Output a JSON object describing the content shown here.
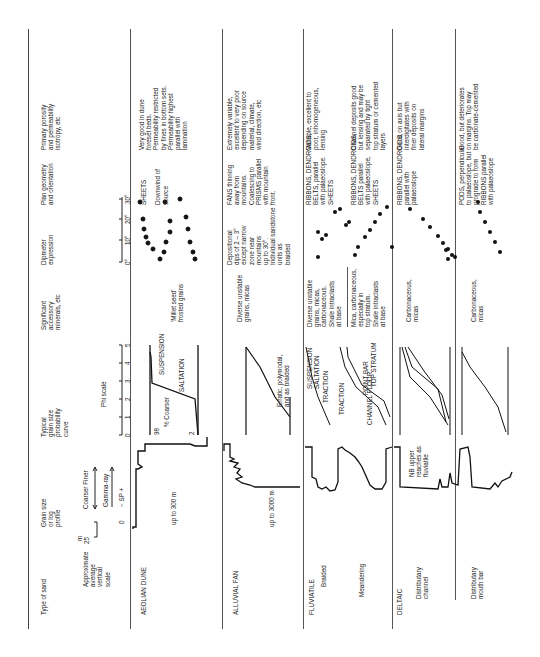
{
  "headers": {
    "type": "Type of sand",
    "scale": "Approximate\naverage\nvertical\nscale",
    "scale_unit": "m",
    "scale_top": "25",
    "scale_bottom": "0",
    "log": "Grain size\nor log\nprofile",
    "log_legend_grain": "Coarser  Finer",
    "log_legend_gamma": "Gamma-ray",
    "log_legend_sp": "−  SP  +",
    "curve": "Typical\ngrain size\nprobability\ncurve",
    "curve_axis": "Phi scale",
    "phi_ticks": [
      "0",
      "1",
      "2",
      "3",
      "4",
      "5"
    ],
    "minerals": "Significant\naccessory\nminerals, etc",
    "dip": "Dipmeter\nexpression",
    "dip_ticks": [
      "0°",
      "10°",
      "20°",
      "30°"
    ],
    "plan": "Plan geometry\nand orientation",
    "porosity": "Primary porosity\nand permeability\nisotropy, etc"
  },
  "rows": [
    {
      "type": "AEOLIAN DUNE",
      "log_note": "up to 300 m",
      "curve_labels": {
        "suspension": "SUSPENSION",
        "saltation": "SALTATION",
        "y98": "98",
        "y2": "2",
        "ylabel": "% Coarser"
      },
      "minerals": "'Millet seed'\nfrosted grains",
      "dip": "",
      "plan": "SHEETS\n\nDownwind of\nsource",
      "porosity": "Very good in dune\nforeset beds.\nPermeability restricted\nby fines in bottom sets.\nPermeability highest\nparallel with\nlamination"
    },
    {
      "type": "ALLUVIAL FAN",
      "log_note": "up to 3000 m",
      "curve_note": "Erratic, polymodal,\nand as braided",
      "minerals": "Diverse unstable\ngrains, micas",
      "dip": "Depositional\ndips of 2 – 3°\nexcept narrow\nzone near\nmountains\nup to 30°.\nIndividual sandstone\nunits as\nbraided",
      "plan": "FANS thinning\naway from\nmountains.\nCoalescing to\nPRISMS parallel\nwith mountain\nfront.",
      "porosity": "Extremely variable,\nexcellent to very poor\ndepending on source\nmaterial, climate,\nwind direction, etc"
    },
    {
      "type": "FLUVIATILE",
      "subtypes": [
        {
          "name": "Braided",
          "curve_labels": {
            "suspension": "SUSPENSION",
            "saltation": "SALTATION",
            "traction": "TRACTION"
          },
          "minerals": "Diverse unstable\ngrains, micas,\ncarbonaceous.\nShale intraclasts\nat base",
          "plan": "RIBBONS, DENDROIDS,\nBELTS, parallel\nwith palaeoslope.\nSHEETS",
          "porosity": "Variable, excellent to\npoor, inhomogeneous,\nlensing"
        },
        {
          "name": "Meandering",
          "curve_labels": {
            "top": "TOP STRATUM",
            "point": "POINT BAR",
            "channel": "CHANNEL FLOOR",
            "traction": "TRACTION"
          },
          "minerals": "Mica, carbonaceous,\nespecially in\ntop stratum.\nShale intraclasts\nat base",
          "plan": "RIBBONS, DENDROIDS,\nBELTS parallel\nwith palaeoslope,\nSHEETS",
          "porosity": "Channel deposits good\nbut lensing and may be\nseparated by tight\ntop stratum or cemented\nlayers"
        }
      ]
    },
    {
      "type": "DELTAIC",
      "subtypes": [
        {
          "name": "Distributary\nchannel",
          "log_note": "NB upper\nreaches as\nfluviatile",
          "minerals": "Carbonaceous,\nmicas",
          "plan": "RIBBONS, DENDROIDS,\nparallel with\npalaeoslope",
          "porosity": "Good on axis but\ninterdigitates with\nfiner deposits on\nlateral margins"
        },
        {
          "name": "Distributary\nmouth bar",
          "minerals": "Carbonaceous,\nmicas",
          "plan": "PODS, perpendicular\nto palaeoslope, but\nprograde to form\nRIBBONS parallel\nwith palaeoslope",
          "porosity": "Good, but deteriorates\non margins. Top may\nbe carbonate-cemented"
        }
      ]
    }
  ],
  "colors": {
    "ink": "#222222",
    "rule": "#555555",
    "paper": "#ffffff"
  }
}
